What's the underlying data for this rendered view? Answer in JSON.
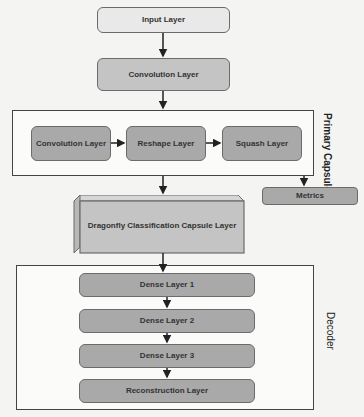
{
  "nodes": {
    "input": "Input Layer",
    "conv1": "Convolution Layer",
    "pc_conv": "Convolution Layer",
    "reshape": "Reshape Layer",
    "squash": "Squash Layer",
    "metrics": "Metrics",
    "dragonfly": "Dragonfly Classification Capsule Layer",
    "dense1": "Dense Layer 1",
    "dense2": "Dense Layer 2",
    "dense3": "Dense Layer 3",
    "reconstruction": "Reconstruction Layer"
  },
  "groups": {
    "primary_capsule": "Primary Capsule",
    "decoder": "Decoder"
  },
  "colors": {
    "light_fill": "#e9e9e9",
    "mid_fill": "#c4c4c4",
    "dark_fill": "#a9a9a9",
    "border": "#6b6b6b"
  }
}
